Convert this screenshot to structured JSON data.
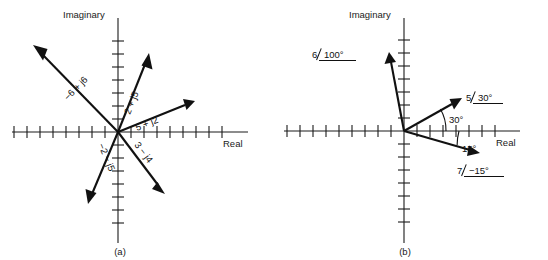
{
  "figure": {
    "type": "phasor-diagram-pair",
    "background_color": "#ffffff",
    "ink_color": "#111111",
    "width": 548,
    "height": 260
  },
  "panel_a": {
    "caption": "(a)",
    "axis_labels": {
      "imaginary": "Imaginary",
      "real": "Real"
    },
    "notation": "rectangular",
    "vectors": [
      {
        "label": "−6 + j6",
        "real": -6,
        "imag": 6,
        "label_rotation_deg": -45
      },
      {
        "label": "2 + j5",
        "real": 2,
        "imag": 5,
        "label_rotation_deg": -68
      },
      {
        "label": "5 + j2",
        "real": 5,
        "imag": 2,
        "label_rotation_deg": -21
      },
      {
        "label": "3 − j4",
        "real": 3,
        "imag": -4,
        "label_rotation_deg": 53
      },
      {
        "label": "−2 − j5",
        "real": -2,
        "imag": -5,
        "label_rotation_deg": 68
      }
    ],
    "axis_ticks": {
      "real_negative_count": 8,
      "real_positive_count": 8,
      "imag_positive_count": 6,
      "imag_negative_count": 6,
      "tick_spacing_units": 1
    }
  },
  "panel_b": {
    "caption": "(b)",
    "axis_labels": {
      "imaginary": "Imaginary",
      "real": "Real"
    },
    "notation": "polar",
    "vectors": [
      {
        "label": "6∠100°",
        "magnitude": 6,
        "angle_deg": 100,
        "display_magnitude": "6",
        "display_angle": "100°"
      },
      {
        "label": "5∠30°",
        "magnitude": 5,
        "angle_deg": 30,
        "display_magnitude": "5",
        "display_angle": "30°"
      },
      {
        "label": "7∠−15°",
        "magnitude": 7,
        "angle_deg": -15,
        "display_magnitude": "7",
        "display_angle": "−15°"
      }
    ],
    "angle_annotations": [
      {
        "label": "30°",
        "angle_deg": 30
      },
      {
        "label": "15°",
        "angle_deg": -15
      }
    ],
    "axis_ticks": {
      "real_negative_count": 8,
      "real_positive_count": 8,
      "imag_positive_count": 6,
      "imag_negative_count": 6,
      "tick_spacing_units": 1
    }
  }
}
